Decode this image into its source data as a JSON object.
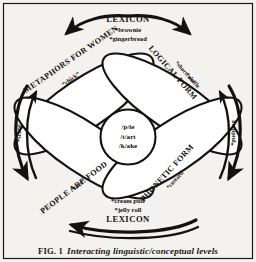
{
  "figure": {
    "caption_prefix": "FIG. 1",
    "caption_title": "Interacting linguistic/conceptual levels",
    "border_color": "#1a1714",
    "background_color": "#f4f2ee",
    "ink_color": "#141210"
  },
  "top_group": {
    "label": "LEXICON",
    "items": [
      "*brownie",
      "*gingerbread"
    ]
  },
  "bottom_group": {
    "label": "LEXICON",
    "items": [
      "*cream puff",
      "*jelly roll"
    ]
  },
  "lobes": [
    {
      "id": "metaphors-for-women",
      "title": "METAPHORS FOR WOMEN",
      "example": "“chick”"
    },
    {
      "id": "logical-form",
      "title": "LOGICAL FORM",
      "items": [
        "*shortcake",
        "*waffle"
      ]
    },
    {
      "id": "people-are-food",
      "title": "PEOPLE ARE FOOD",
      "example": "“tart”"
    },
    {
      "id": "phonetic-form",
      "title": "PHONETIC FORM",
      "items": [
        "*custard"
      ]
    }
  ],
  "center": {
    "items": [
      "/p/ie",
      "/t/art",
      "/k/ake"
    ]
  },
  "side_notes": {
    "left": "*scone",
    "right": "*pudding"
  }
}
